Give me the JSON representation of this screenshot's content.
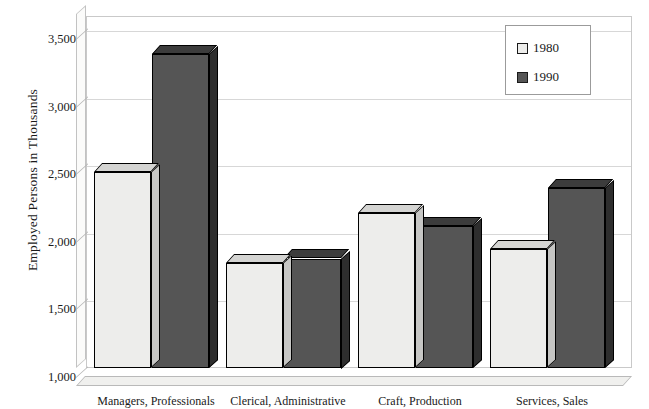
{
  "chart_data": {
    "type": "bar",
    "title": "",
    "xlabel": "",
    "ylabel": "Employed Persons in Thousands",
    "categories": [
      "Managers, Professionals",
      "Clerical, Administrative",
      "Craft, Production",
      "Services, Sales"
    ],
    "series": [
      {
        "name": "1980",
        "values": [
          2450,
          1780,
          2150,
          1880
        ],
        "color": "#ededeb"
      },
      {
        "name": "1990",
        "values": [
          3320,
          1810,
          2050,
          2330
        ],
        "color": "#555555"
      }
    ],
    "ylim": [
      1000,
      3500
    ],
    "yticks": [
      1000,
      1500,
      2000,
      2500,
      3000,
      3500
    ],
    "ytick_labels": [
      "1,000",
      "1,500",
      "2,000",
      "2,500",
      "3,000",
      "3,500"
    ],
    "grid": true,
    "legend_position": "top-right",
    "style": "3d-column"
  },
  "legend": {
    "entries": [
      {
        "label": "1980"
      },
      {
        "label": "1990"
      }
    ]
  },
  "axis": {
    "y_title": "Employed Persons in Thousands"
  }
}
